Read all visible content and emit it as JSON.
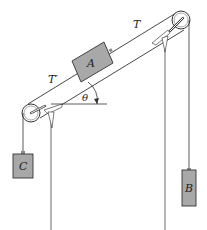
{
  "diagram": {
    "type": "physics-pulley-incline",
    "labels": {
      "block_a": "A",
      "block_b": "B",
      "block_c": "C",
      "tension_upper": "T",
      "tension_lower": "T′",
      "angle": "θ"
    },
    "colors": {
      "block_fill": "#a8a8a8",
      "line": "#333333",
      "background": "#ffffff"
    }
  }
}
